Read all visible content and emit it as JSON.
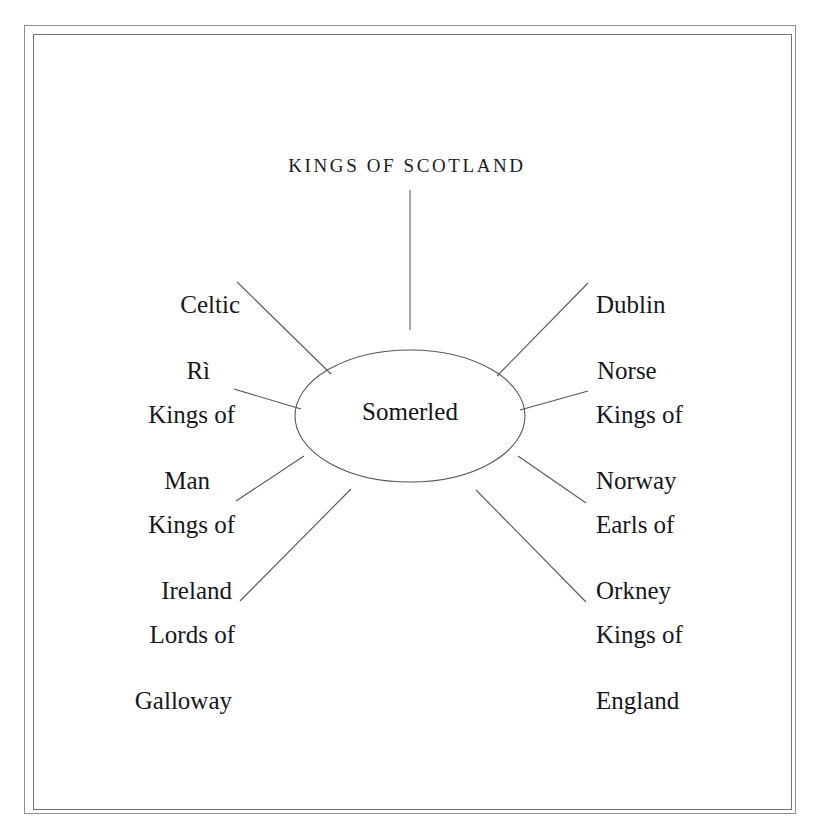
{
  "diagram": {
    "type": "radial-hub-and-spoke",
    "title": "KINGS OF SCOTLAND",
    "center": {
      "label": "Somerled",
      "shape": "ellipse",
      "cx": 410,
      "cy": 416,
      "rx": 115,
      "ry": 66
    },
    "stroke_color": "#55585f",
    "frame_color": "#8d9097",
    "text_color": "#17171c",
    "nodes": [
      {
        "id": "kings-of-scotland",
        "label": "KINGS OF SCOTLAND",
        "line1": "KINGS OF SCOTLAND",
        "line2": "",
        "side": "top",
        "connector": {
          "x1": 410,
          "y1": 190,
          "x2": 410,
          "y2": 330
        }
      },
      {
        "id": "celtic-ri",
        "label": "Celtic Rì",
        "line1": "Celtic",
        "line2": "Rì",
        "side": "left",
        "connector": {
          "x1": 237,
          "y1": 282,
          "x2": 331,
          "y2": 374
        }
      },
      {
        "id": "kings-of-man",
        "label": "Kings of Man",
        "line1": "Kings of",
        "line2": "Man",
        "side": "left",
        "connector": {
          "x1": 234,
          "y1": 389,
          "x2": 301,
          "y2": 409
        }
      },
      {
        "id": "kings-of-ireland",
        "label": "Kings of Ireland",
        "line1": "Kings of",
        "line2": "Ireland",
        "side": "left",
        "connector": {
          "x1": 236,
          "y1": 501,
          "x2": 304,
          "y2": 456
        }
      },
      {
        "id": "lords-of-galloway",
        "label": "Lords of Galloway",
        "line1": "Lords of",
        "line2": "Galloway",
        "side": "left",
        "connector": {
          "x1": 240,
          "y1": 601,
          "x2": 351,
          "y2": 489
        }
      },
      {
        "id": "dublin-norse",
        "label": "Dublin Norse",
        "line1": "Dublin",
        "line2": "Norse",
        "side": "right",
        "connector": {
          "x1": 497,
          "y1": 376,
          "x2": 588,
          "y2": 283
        }
      },
      {
        "id": "kings-of-norway",
        "label": "Kings of Norway",
        "line1": "Kings of",
        "line2": "Norway",
        "side": "right",
        "connector": {
          "x1": 520,
          "y1": 410,
          "x2": 588,
          "y2": 391
        }
      },
      {
        "id": "earls-of-orkney",
        "label": "Earls of Orkney",
        "line1": "Earls of",
        "line2": "Orkney",
        "side": "right",
        "connector": {
          "x1": 518,
          "y1": 456,
          "x2": 586,
          "y2": 503
        }
      },
      {
        "id": "kings-of-england",
        "label": "Kings of England",
        "line1": "Kings of",
        "line2": "England",
        "side": "right",
        "connector": {
          "x1": 476,
          "y1": 490,
          "x2": 586,
          "y2": 602
        }
      }
    ]
  }
}
